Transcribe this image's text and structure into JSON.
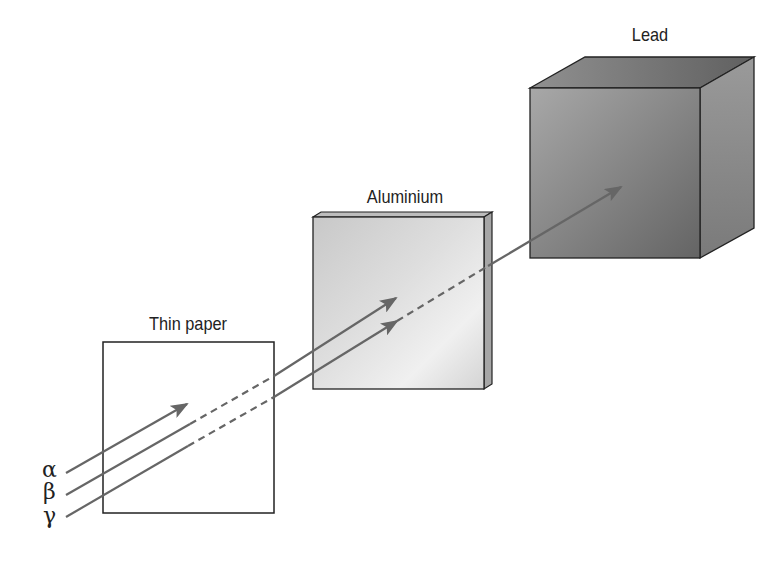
{
  "diagram": {
    "colors": {
      "background": "#ffffff",
      "arrow": "#666666",
      "outline": "#222222",
      "paper_fill": "#ffffff",
      "aluminium_light": "#ececec",
      "aluminium_dark": "#c4c4c4",
      "aluminium_edge": "#a8a8a8",
      "lead_front_light": "#a8a8a8",
      "lead_front_dark": "#686868",
      "lead_top": "#7a7a7a",
      "lead_side": "#8c8c8c"
    },
    "barriers": [
      {
        "id": "paper",
        "label": "Thin paper",
        "stops": "alpha"
      },
      {
        "id": "aluminium",
        "label": "Aluminium",
        "stops": "beta"
      },
      {
        "id": "lead",
        "label": "Lead",
        "stops": "gamma"
      }
    ],
    "radiation": [
      {
        "id": "alpha",
        "symbol": "α",
        "absorbed_by": "Thin paper"
      },
      {
        "id": "beta",
        "symbol": "β",
        "absorbed_by": "Aluminium"
      },
      {
        "id": "gamma",
        "symbol": "γ",
        "absorbed_by": "Lead"
      }
    ]
  }
}
